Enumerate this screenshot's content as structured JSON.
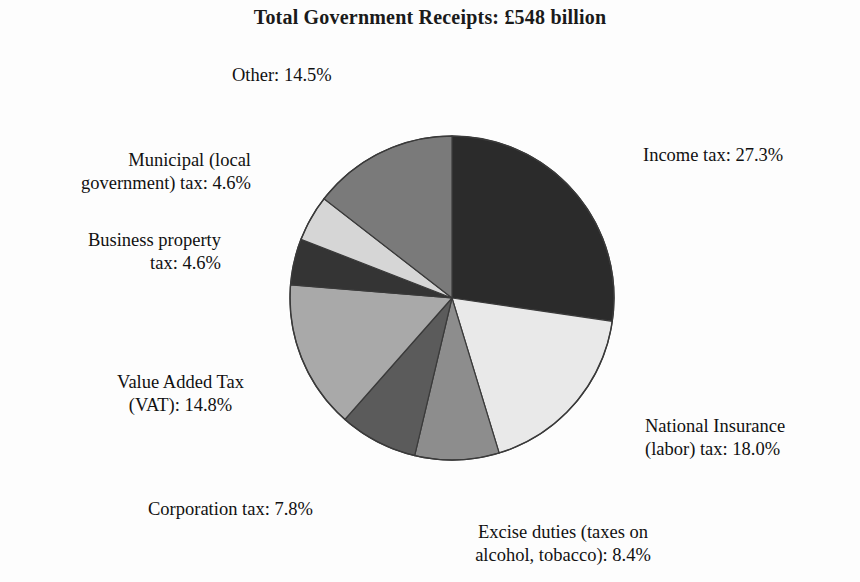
{
  "title": "Total Government Receipts: £548 billion",
  "chart_data": {
    "type": "pie",
    "title": "Total Government Receipts: £548 billion",
    "total_label": "£548 billion",
    "total_value": 548,
    "units": "billion GBP",
    "start_angle_deg": 0,
    "direction": "clockwise",
    "legend_position": "outside-labels",
    "grid": false,
    "categories": [
      "Income tax",
      "National Insurance (labor) tax",
      "Excise duties (taxes on alcohol, tobacco)",
      "Corporation tax",
      "Value Added Tax (VAT)",
      "Business property tax",
      "Municipal (local government) tax",
      "Other"
    ],
    "values": [
      27.3,
      18.0,
      8.4,
      7.8,
      14.8,
      4.6,
      4.6,
      14.5
    ],
    "colors": [
      "#2b2b2b",
      "#e9e9e9",
      "#8d8d8d",
      "#5b5b5b",
      "#a9a9a9",
      "#343434",
      "#d6d6d6",
      "#7a7a7a"
    ],
    "slices": [
      {
        "name": "Income tax",
        "value": 27.3,
        "label": "Income tax: 27.3%",
        "color": "#2b2b2b"
      },
      {
        "name": "National Insurance (labor) tax",
        "value": 18.0,
        "label": "National Insurance\n(labor) tax: 18.0%",
        "color": "#e9e9e9"
      },
      {
        "name": "Excise duties (taxes on alcohol, tobacco)",
        "value": 8.4,
        "label": "Excise duties (taxes on\nalcohol, tobacco): 8.4%",
        "color": "#8d8d8d"
      },
      {
        "name": "Corporation tax",
        "value": 7.8,
        "label": "Corporation tax: 7.8%",
        "color": "#5b5b5b"
      },
      {
        "name": "Value Added Tax (VAT)",
        "value": 14.8,
        "label": "Value Added Tax\n(VAT): 14.8%",
        "color": "#a9a9a9"
      },
      {
        "name": "Business property tax",
        "value": 4.6,
        "label": "Business property\ntax: 4.6%",
        "color": "#343434"
      },
      {
        "name": "Municipal (local government) tax",
        "value": 4.6,
        "label": "Municipal (local\ngovernment) tax: 4.6%",
        "color": "#d6d6d6"
      },
      {
        "name": "Other",
        "value": 14.5,
        "label": "Other: 14.5%",
        "color": "#7a7a7a"
      }
    ]
  },
  "labels": {
    "income": "Income tax: 27.3%",
    "national": "National Insurance\n(labor) tax: 18.0%",
    "excise": "Excise duties (taxes on\nalcohol, tobacco): 8.4%",
    "corporation": "Corporation tax: 7.8%",
    "vat": "Value Added Tax\n(VAT): 14.8%",
    "business": "Business property\ntax: 4.6%",
    "municipal": "Municipal (local\ngovernment) tax: 4.6%",
    "other": "Other: 14.5%"
  },
  "geometry": {
    "center_x": 452,
    "center_y": 298,
    "radius": 162,
    "outline_color": "#3a3a3a"
  }
}
